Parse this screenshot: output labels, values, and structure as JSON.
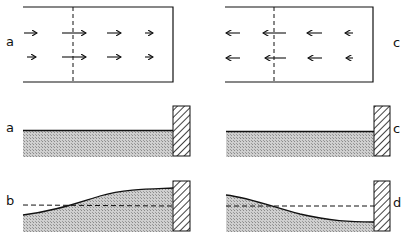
{
  "figure": {
    "labels": {
      "top_left": "a",
      "top_right": "c",
      "mid_left": "a",
      "mid_right": "c",
      "bottom_left": "b",
      "bottom_right": "d"
    },
    "panels": [
      {
        "id": "velocity-a",
        "description": "channel plan view, flow arrows pointing right",
        "arrow_direction": "right"
      },
      {
        "id": "velocity-c",
        "description": "channel plan view, flow arrows pointing left",
        "arrow_direction": "left"
      },
      {
        "id": "profile-a",
        "description": "level water surface against wall"
      },
      {
        "id": "profile-c",
        "description": "level water surface against wall"
      },
      {
        "id": "profile-b",
        "description": "water surface rising toward wall, dashed still-water level"
      },
      {
        "id": "profile-d",
        "description": "water surface falling toward wall, dashed still-water level"
      }
    ],
    "colors": {
      "ink": "#111111",
      "water_fill": "#bdbdbd"
    }
  }
}
